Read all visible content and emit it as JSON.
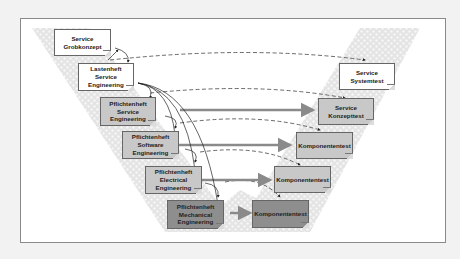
{
  "diagram": {
    "type": "V-Modell",
    "left_branch": [
      {
        "id": "service-grobkonzept",
        "lines": [
          "Service",
          "Grobkonzept"
        ],
        "shade": "white"
      },
      {
        "id": "lastenheft-service-engineering",
        "lines": [
          "Lastenheft",
          "Service",
          "Engineering"
        ],
        "shade": "white"
      },
      {
        "id": "pflichtenheft-service-engineering",
        "lines": [
          "Pflichtenheft",
          "Service",
          "Engineering"
        ],
        "shade": "light"
      },
      {
        "id": "pflichtenheft-software-engineering",
        "lines": [
          "Pflichtenheft",
          "Software",
          "Engineering"
        ],
        "shade": "light"
      },
      {
        "id": "pflichtenheft-electrical-engineering",
        "lines": [
          "Pflichtenheft",
          "Electrical",
          "Engineering"
        ],
        "shade": "light"
      },
      {
        "id": "pflichtenheft-mechanical-engineering",
        "lines": [
          "Pflichtenheft",
          "Mechanical",
          "Engineering"
        ],
        "shade": "dark"
      }
    ],
    "right_branch": [
      {
        "id": "service-systemtest",
        "lines": [
          "Service",
          "Systemtest"
        ],
        "shade": "white"
      },
      {
        "id": "service-konzepttest",
        "lines": [
          "Service",
          "Konzepttest"
        ],
        "shade": "light"
      },
      {
        "id": "komponententest-software",
        "lines": [
          "Komponententest"
        ],
        "shade": "light"
      },
      {
        "id": "komponententest-electrical",
        "lines": [
          "Komponententest"
        ],
        "shade": "light"
      },
      {
        "id": "komponententest-mechanical",
        "lines": [
          "Komponententest"
        ],
        "shade": "dark"
      }
    ],
    "colors": {
      "frame_border": "#8a8a8a",
      "hatch": "#c9c9c9",
      "solid_arrow": "#8a8a8a",
      "dashed_line": "#444444",
      "box_white": "#ffffff",
      "box_light": "#c8c8c8",
      "box_dark": "#8e8e8e"
    }
  }
}
